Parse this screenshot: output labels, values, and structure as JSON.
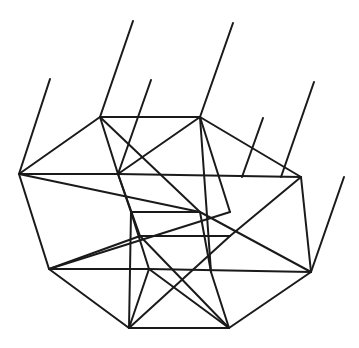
{
  "diagram": {
    "stroke_color": "#1a1a1a",
    "background": "#ffffff",
    "vertices": {
      "T1": [
        100,
        117
      ],
      "T2": [
        200,
        117
      ],
      "L1": [
        19,
        174
      ],
      "R1": [
        301,
        177
      ],
      "C1": [
        118,
        174
      ],
      "C2": [
        230,
        212
      ],
      "M1": [
        150,
        131
      ],
      "M2": [
        131,
        212
      ],
      "M3": [
        200,
        212
      ],
      "M4": [
        140,
        236
      ],
      "M5": [
        230,
        236
      ],
      "L2": [
        49,
        269
      ],
      "R2": [
        311,
        272
      ],
      "I1": [
        149,
        269
      ],
      "I2": [
        211,
        272
      ],
      "B1": [
        129,
        328
      ],
      "B2": [
        229,
        328
      ]
    },
    "edges": [
      [
        "T1",
        "T2"
      ],
      [
        "T1",
        "L1"
      ],
      [
        "T2",
        "R1"
      ],
      [
        "L1",
        "C1"
      ],
      [
        "C1",
        "R1"
      ],
      [
        "L1",
        "L2"
      ],
      [
        "R1",
        "R2"
      ],
      [
        "L2",
        "B1"
      ],
      [
        "R2",
        "B2"
      ],
      [
        "B1",
        "B2"
      ],
      [
        "L2",
        "I1"
      ],
      [
        "I1",
        "R2"
      ],
      [
        "T1",
        "C1"
      ],
      [
        "T1",
        "M3"
      ],
      [
        "T2",
        "C1"
      ],
      [
        "T2",
        "I2"
      ],
      [
        "T2",
        "C2"
      ],
      [
        "C1",
        "M2"
      ],
      [
        "C1",
        "M4"
      ],
      [
        "L1",
        "M3"
      ],
      [
        "M2",
        "M3"
      ],
      [
        "M2",
        "I1"
      ],
      [
        "M2",
        "B1"
      ],
      [
        "M3",
        "I2"
      ],
      [
        "M3",
        "R2"
      ],
      [
        "M4",
        "M5"
      ],
      [
        "M4",
        "B2"
      ],
      [
        "M4",
        "L2"
      ],
      [
        "M5",
        "B1"
      ],
      [
        "M5",
        "R1"
      ],
      [
        "I1",
        "B1"
      ],
      [
        "I1",
        "B2"
      ],
      [
        "I2",
        "B2"
      ],
      [
        "C2",
        "L2"
      ]
    ],
    "rays": [
      {
        "from": [
          19,
          174
        ],
        "to": [
          50,
          79
        ]
      },
      {
        "from": [
          100,
          117
        ],
        "to": [
          133,
          21
        ]
      },
      {
        "from": [
          118,
          174
        ],
        "to": [
          151,
          80
        ]
      },
      {
        "from": [
          200,
          117
        ],
        "to": [
          233,
          23
        ]
      },
      {
        "from": [
          242,
          177
        ],
        "to": [
          263,
          118
        ]
      },
      {
        "from": [
          281,
          177
        ],
        "to": [
          314,
          82
        ]
      },
      {
        "from": [
          311,
          272
        ],
        "to": [
          344,
          177
        ]
      }
    ]
  }
}
